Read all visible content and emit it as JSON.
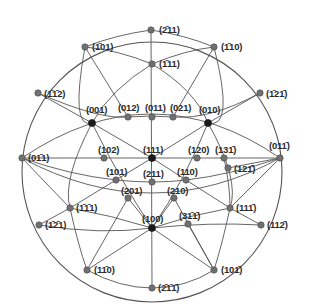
{
  "diagram": {
    "type": "stereographic-projection",
    "colors": {
      "background": "#ffffff",
      "line": "#555555",
      "pole_gray": "#707070",
      "pole_major": "#1a1a1a",
      "text": "#2a2a2a"
    },
    "circle": {
      "cx": 152,
      "cy": 172,
      "r": 130
    },
    "poles": [
      {
        "id": "m211",
        "label": "(2̄11)",
        "x": 151,
        "y": 30,
        "lx": 159,
        "ly": 25,
        "major": false
      },
      {
        "id": "m101",
        "label": "(1̄01)",
        "x": 85,
        "y": 47,
        "lx": 92,
        "ly": 42,
        "major": false
      },
      {
        "id": "m110",
        "label": "(1̄10)",
        "x": 214,
        "y": 47,
        "lx": 221,
        "ly": 42,
        "major": false
      },
      {
        "id": "m111",
        "label": "(1̄11)",
        "x": 152,
        "y": 64,
        "lx": 159,
        "ly": 59,
        "major": false
      },
      {
        "id": "mm112",
        "label": "(1̄1̄2)",
        "x": 38,
        "y": 93,
        "lx": 44,
        "ly": 89,
        "major": false
      },
      {
        "id": "m12m1",
        "label": "(1̄21̄)",
        "x": 260,
        "y": 93,
        "lx": 266,
        "ly": 89,
        "major": false
      },
      {
        "id": "p001",
        "label": "(001)",
        "x": 92,
        "y": 123,
        "lx": 86,
        "ly": 105,
        "major": true
      },
      {
        "id": "p012",
        "label": "(012)",
        "x": 128,
        "y": 117,
        "lx": 118,
        "ly": 103,
        "major": false
      },
      {
        "id": "p011",
        "label": "(011)",
        "x": 152,
        "y": 117,
        "lx": 145,
        "ly": 103,
        "major": false
      },
      {
        "id": "p021",
        "label": "(021)",
        "x": 173,
        "y": 117,
        "lx": 170,
        "ly": 103,
        "major": false
      },
      {
        "id": "p010",
        "label": "(010)",
        "x": 208,
        "y": 123,
        "lx": 199,
        "ly": 105,
        "major": true
      },
      {
        "id": "p0m11",
        "label": "(01̄1)",
        "x": 22,
        "y": 158,
        "lx": 28,
        "ly": 153,
        "major": false
      },
      {
        "id": "p01m1",
        "label": "(011̄)",
        "x": 280,
        "y": 158,
        "lx": 269,
        "ly": 141,
        "major": false
      },
      {
        "id": "p102",
        "label": "(102)",
        "x": 104,
        "y": 158,
        "lx": 98,
        "ly": 145,
        "major": false
      },
      {
        "id": "p111",
        "label": "(111)",
        "x": 152,
        "y": 158,
        "lx": 143,
        "ly": 145,
        "major": true
      },
      {
        "id": "p120",
        "label": "(120)",
        "x": 197,
        "y": 158,
        "lx": 188,
        "ly": 145,
        "major": false
      },
      {
        "id": "p13m1",
        "label": "(131̄)",
        "x": 224,
        "y": 158,
        "lx": 215,
        "ly": 145,
        "major": false
      },
      {
        "id": "p101",
        "label": "(101)",
        "x": 116,
        "y": 180,
        "lx": 106,
        "ly": 167,
        "major": false
      },
      {
        "id": "p211",
        "label": "(211)",
        "x": 152,
        "y": 182,
        "lx": 143,
        "ly": 169,
        "major": false
      },
      {
        "id": "p110",
        "label": "(110)",
        "x": 186,
        "y": 180,
        "lx": 177,
        "ly": 167,
        "major": false
      },
      {
        "id": "p12m1",
        "label": "(121̄)",
        "x": 228,
        "y": 168,
        "lx": 234,
        "ly": 164,
        "major": false
      },
      {
        "id": "p201",
        "label": "(201)",
        "x": 128,
        "y": 198,
        "lx": 121,
        "ly": 186,
        "major": false
      },
      {
        "id": "p210",
        "label": "(210)",
        "x": 174,
        "y": 198,
        "lx": 167,
        "ly": 186,
        "major": false
      },
      {
        "id": "pm1m11",
        "label": "(1̄1̄1)",
        "x": 70,
        "y": 208,
        "lx": 76,
        "ly": 203,
        "major": false
      },
      {
        "id": "p11m1",
        "label": "(111̄)",
        "x": 230,
        "y": 208,
        "lx": 236,
        "ly": 203,
        "major": false
      },
      {
        "id": "p100",
        "label": "(100)",
        "x": 152,
        "y": 228,
        "lx": 142,
        "ly": 214,
        "major": true
      },
      {
        "id": "p31m1",
        "label": "(31̄1̄)",
        "x": 188,
        "y": 224,
        "lx": 179,
        "ly": 211,
        "major": false
      },
      {
        "id": "pm1m21",
        "label": "(1̄2̄1)",
        "x": 39,
        "y": 225,
        "lx": 45,
        "ly": 220,
        "major": false
      },
      {
        "id": "p112m",
        "label": "(112̄)",
        "x": 261,
        "y": 225,
        "lx": 267,
        "ly": 220,
        "major": false
      },
      {
        "id": "p1m10",
        "label": "(11̄0)",
        "x": 87,
        "y": 270,
        "lx": 94,
        "ly": 265,
        "major": false
      },
      {
        "id": "p10m1",
        "label": "(101̄)",
        "x": 214,
        "y": 270,
        "lx": 221,
        "ly": 265,
        "major": false
      },
      {
        "id": "pm2m1m1",
        "label": "(2̄1̄1̄)",
        "x": 152,
        "y": 288,
        "lx": 158,
        "ly": 283,
        "major": false
      }
    ],
    "straight_lines": [
      [
        "m211",
        "pm2m1m1"
      ],
      [
        "p0m11",
        "p01m1"
      ],
      [
        "m101",
        "p012"
      ],
      [
        "m110",
        "p021"
      ],
      [
        "p001",
        "p111"
      ],
      [
        "p010",
        "p111"
      ],
      [
        "p111",
        "p110"
      ],
      [
        "p111",
        "p101"
      ],
      [
        "p110",
        "p11m1"
      ],
      [
        "p101",
        "pm1m11"
      ],
      [
        "p201",
        "p1m10"
      ],
      [
        "p210",
        "p10m1"
      ],
      [
        "p100",
        "p1m10"
      ],
      [
        "p100",
        "p10m1"
      ],
      [
        "p010",
        "m12m1"
      ],
      [
        "p001",
        "mm112"
      ],
      [
        "p12m1",
        "p01m1"
      ],
      [
        "p11m1",
        "p01m1"
      ],
      [
        "pm1m11",
        "p0m11"
      ],
      [
        "pm1m21",
        "pm1m11"
      ],
      [
        "p112m",
        "p11m1"
      ],
      [
        "p31m1",
        "p10m1"
      ],
      [
        "p100",
        "p210"
      ],
      [
        "p100",
        "p201"
      ]
    ],
    "curved_arcs": [
      {
        "d": "M22,158 Q152,70 280,158"
      },
      {
        "d": "M22,158 Q152,228 280,158"
      },
      {
        "d": "M38,93 Q100,120 128,117 Q152,115 173,117 Q210,120 260,93"
      },
      {
        "d": "M39,225 Q100,235 152,228 Q210,222 261,225"
      },
      {
        "d": "M85,47 Q70,130 92,123"
      },
      {
        "d": "M214,47 Q235,130 208,123"
      },
      {
        "d": "M85,47 Q115,35 151,30 Q185,35 214,47"
      },
      {
        "d": "M85,47 Q118,50 152,64 Q186,50 214,47"
      },
      {
        "d": "M92,123 Q120,180 152,228"
      },
      {
        "d": "M208,123 Q185,180 152,228"
      },
      {
        "d": "M92,123 Q62,180 70,208 Q78,245 87,270"
      },
      {
        "d": "M208,123 Q240,180 230,208 Q222,245 214,270"
      },
      {
        "d": "M70,208 Q110,215 152,228"
      },
      {
        "d": "M230,208 Q190,215 152,228"
      },
      {
        "d": "M87,270 Q120,288 152,288 Q185,288 214,270"
      },
      {
        "d": "M116,180 Q135,182 152,182 Q170,182 186,180"
      },
      {
        "d": "M22,158 Q70,175 116,180"
      },
      {
        "d": "M280,158 Q230,175 186,180"
      },
      {
        "d": "M152,64 Q110,90 92,123"
      },
      {
        "d": "M152,64 Q195,90 208,123"
      },
      {
        "d": "M224,158 Q230,185 230,208"
      }
    ]
  }
}
